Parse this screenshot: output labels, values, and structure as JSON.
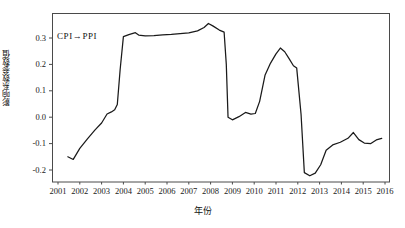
{
  "chart_data": {
    "type": "line",
    "title": "",
    "annotation": "CPI→PPI",
    "xlabel": "年份",
    "ylabel": "影响系数参数值",
    "xlim": [
      2001,
      2016
    ],
    "ylim": [
      -0.25,
      0.38
    ],
    "grid": false,
    "legend_position": "none",
    "xticks": [
      "2001",
      "2002",
      "2003",
      "2004",
      "2005",
      "2006",
      "2007",
      "2008",
      "2009",
      "2010",
      "2011",
      "2012",
      "2013",
      "2014",
      "2015",
      "2016"
    ],
    "yticks": [
      "0.3",
      "0.2",
      "0.1",
      "0.0",
      "-0.1",
      "-0.2"
    ],
    "ytick_values": [
      0.3,
      0.2,
      0.1,
      0.0,
      -0.1,
      -0.2
    ],
    "line_color": "#1a1a1a",
    "series": [
      {
        "name": "CPI→PPI",
        "x": [
          2001.45,
          2001.7,
          2002.0,
          2002.35,
          2002.7,
          2003.0,
          2003.25,
          2003.45,
          2003.6,
          2003.72,
          2003.85,
          2004.0,
          2004.25,
          2004.55,
          2004.7,
          2005.0,
          2005.4,
          2005.8,
          2006.2,
          2006.6,
          2007.0,
          2007.4,
          2007.7,
          2007.9,
          2008.1,
          2008.4,
          2008.62,
          2008.72,
          2008.8,
          2009.0,
          2009.3,
          2009.6,
          2009.85,
          2010.05,
          2010.25,
          2010.5,
          2010.75,
          2011.0,
          2011.2,
          2011.4,
          2011.6,
          2011.8,
          2011.95,
          2012.15,
          2012.3,
          2012.55,
          2012.8,
          2013.05,
          2013.3,
          2013.6,
          2013.95,
          2014.3,
          2014.55,
          2014.8,
          2015.05,
          2015.35,
          2015.6,
          2015.85
        ],
        "y": [
          -0.15,
          -0.16,
          -0.118,
          -0.082,
          -0.048,
          -0.022,
          0.012,
          0.02,
          0.028,
          0.048,
          0.18,
          0.305,
          0.313,
          0.32,
          0.311,
          0.308,
          0.309,
          0.312,
          0.314,
          0.317,
          0.319,
          0.327,
          0.34,
          0.355,
          0.346,
          0.33,
          0.322,
          0.2,
          0.0,
          -0.01,
          0.002,
          0.018,
          0.012,
          0.014,
          0.06,
          0.16,
          0.205,
          0.24,
          0.262,
          0.248,
          0.222,
          0.195,
          0.186,
          0.01,
          -0.21,
          -0.222,
          -0.212,
          -0.18,
          -0.125,
          -0.105,
          -0.095,
          -0.08,
          -0.058,
          -0.085,
          -0.098,
          -0.1,
          -0.086,
          -0.08
        ]
      }
    ]
  },
  "axes": {
    "frame": {
      "left": 52,
      "top": 13,
      "right": 390,
      "bottom": 182
    }
  }
}
